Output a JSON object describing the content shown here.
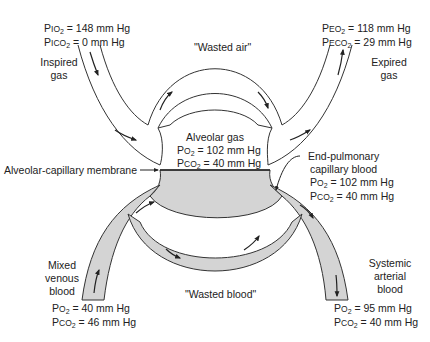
{
  "inspired": {
    "po2_prefix": "P",
    "po2_sc": "IO",
    "po2_value": " = 148 mm Hg",
    "pco2_prefix": "P",
    "pco2_sc": "ICO",
    "pco2_value": " = 0 mm Hg",
    "label_line1": "Inspired",
    "label_line2": "gas"
  },
  "expired": {
    "po2_prefix": "P",
    "po2_sc": "EO",
    "po2_value": " = 118 mm Hg",
    "pco2_prefix": "P",
    "pco2_sc": "ECO",
    "pco2_value": " = 29 mm Hg",
    "label_line1": "Expired",
    "label_line2": "gas"
  },
  "wasted_air": "\"Wasted air\"",
  "alveolar": {
    "title": "Alveolar gas",
    "po2_prefix": "P",
    "po2_sc": "O",
    "po2_value": " = 102 mm Hg",
    "pco2_prefix": "P",
    "pco2_sc": "CO",
    "pco2_value": " = 40 mm Hg"
  },
  "membrane_label": "Alveolar-capillary membrane",
  "end_pulmonary": {
    "line1": "End-pulmonary",
    "line2": "capillary blood",
    "po2_prefix": "P",
    "po2_sc": "O",
    "po2_value": " = 102 mm Hg",
    "pco2_prefix": "P",
    "pco2_sc": "CO",
    "pco2_value": " = 40 mm Hg"
  },
  "mixed_venous": {
    "line1": "Mixed",
    "line2": "venous",
    "line3": "blood",
    "po2_prefix": "P",
    "po2_sc": "O",
    "po2_value": " = 40 mm Hg",
    "pco2_prefix": "P",
    "pco2_sc": "CO",
    "pco2_value": " = 46 mm Hg"
  },
  "systemic_arterial": {
    "line1": "Systemic",
    "line2": "arterial",
    "line3": "blood",
    "po2_prefix": "P",
    "po2_sc": "O",
    "po2_value": " = 95 mm Hg",
    "pco2_prefix": "P",
    "pco2_sc": "CO",
    "pco2_value": " = 40 mm Hg"
  },
  "wasted_blood": "\"Wasted blood\"",
  "subscript_2": "2",
  "colors": {
    "blood_fill": "#d4d4d4",
    "stroke": "#333333",
    "background": "#ffffff"
  }
}
